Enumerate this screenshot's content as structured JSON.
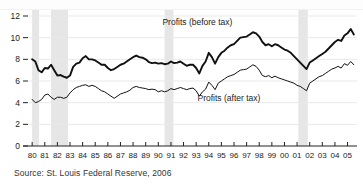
{
  "figure": {
    "source_note": "Source: St. Louis Federal Reserve, 2006",
    "label_before_tax": "Profits (before tax)",
    "label_after_tax": "Profits (after tax)"
  },
  "colors": {
    "before_tax_line": "#111111",
    "after_tax_line": "#111111",
    "recession_band": "#e6e6e6",
    "gridline": "#e9e9e9",
    "axis": "#222222",
    "background": "#ffffff"
  },
  "chart_data": {
    "type": "line",
    "title": "",
    "subtitle": "",
    "xlabel": "",
    "ylabel": "",
    "xlim": [
      1979.75,
      2005.75
    ],
    "ylim": [
      0,
      12
    ],
    "yticks": [
      0,
      2,
      4,
      6,
      8,
      10,
      12
    ],
    "ytick_labels": [
      "0",
      "2",
      "4",
      "6",
      "8",
      "10",
      "12"
    ],
    "xticks": [
      1980,
      1981,
      1982,
      1983,
      1984,
      1985,
      1986,
      1987,
      1988,
      1989,
      1990,
      1991,
      1992,
      1993,
      1994,
      1995,
      1996,
      1997,
      1998,
      1999,
      2000,
      2001,
      2002,
      2003,
      2004,
      2005
    ],
    "xtick_labels": [
      "80",
      "81",
      "82",
      "83",
      "84",
      "85",
      "86",
      "87",
      "88",
      "89",
      "90",
      "91",
      "92",
      "93",
      "94",
      "95",
      "96",
      "97",
      "98",
      "99",
      "00",
      "01",
      "02",
      "03",
      "04",
      "05"
    ],
    "grid": true,
    "legend_position": "inline-annotation",
    "annotations": [
      {
        "text": "Profits (before tax)",
        "x": 1993.1,
        "y": 11.2
      },
      {
        "text": "Profits (after tax)",
        "x": 1995.6,
        "y": 4.15
      }
    ],
    "shaded_regions": [
      {
        "label": "recession",
        "x0": 1980.0,
        "x1": 1980.55
      },
      {
        "label": "recession",
        "x0": 1981.5,
        "x1": 1982.85
      },
      {
        "label": "recession",
        "x0": 1990.5,
        "x1": 1991.2
      },
      {
        "label": "recession",
        "x0": 2001.1,
        "x1": 2001.85
      }
    ],
    "series": [
      {
        "name": "Profits (before tax)",
        "x": [
          1980.0,
          1980.25,
          1980.5,
          1980.75,
          1981.0,
          1981.25,
          1981.5,
          1981.75,
          1982.0,
          1982.25,
          1982.5,
          1982.75,
          1983.0,
          1983.25,
          1983.5,
          1983.75,
          1984.0,
          1984.25,
          1984.5,
          1984.75,
          1985.0,
          1985.25,
          1985.5,
          1985.75,
          1986.0,
          1986.25,
          1986.5,
          1986.75,
          1987.0,
          1987.25,
          1987.5,
          1987.75,
          1988.0,
          1988.25,
          1988.5,
          1988.75,
          1989.0,
          1989.25,
          1989.5,
          1989.75,
          1990.0,
          1990.25,
          1990.5,
          1990.75,
          1991.0,
          1991.25,
          1991.5,
          1991.75,
          1992.0,
          1992.25,
          1992.5,
          1992.75,
          1993.0,
          1993.25,
          1993.5,
          1993.75,
          1994.0,
          1994.25,
          1994.5,
          1994.75,
          1995.0,
          1995.25,
          1995.5,
          1995.75,
          1996.0,
          1996.25,
          1996.5,
          1996.75,
          1997.0,
          1997.25,
          1997.5,
          1997.75,
          1998.0,
          1998.25,
          1998.5,
          1998.75,
          1999.0,
          1999.25,
          1999.5,
          1999.75,
          2000.0,
          2000.25,
          2000.5,
          2000.75,
          2001.0,
          2001.25,
          2001.5,
          2001.75,
          2002.0,
          2002.25,
          2002.5,
          2002.75,
          2003.0,
          2003.25,
          2003.5,
          2003.75,
          2004.0,
          2004.25,
          2004.5,
          2004.75,
          2005.0,
          2005.25,
          2005.5
        ],
        "y": [
          8.0,
          7.8,
          7.0,
          6.8,
          7.2,
          7.15,
          7.5,
          7.0,
          6.5,
          6.55,
          6.4,
          6.3,
          6.5,
          7.3,
          7.6,
          7.7,
          8.1,
          8.3,
          8.0,
          8.0,
          7.9,
          7.7,
          7.5,
          7.5,
          7.2,
          7.0,
          7.1,
          7.3,
          7.5,
          7.6,
          7.8,
          8.0,
          8.2,
          8.35,
          8.2,
          8.15,
          8.0,
          7.75,
          7.65,
          7.7,
          7.6,
          7.65,
          7.55,
          7.6,
          7.8,
          7.65,
          7.7,
          7.8,
          7.6,
          7.4,
          7.5,
          7.5,
          7.2,
          6.7,
          7.4,
          7.8,
          8.6,
          8.2,
          7.6,
          8.2,
          8.6,
          8.8,
          9.1,
          9.3,
          9.4,
          9.7,
          10.0,
          10.05,
          10.1,
          10.3,
          10.5,
          10.4,
          10.1,
          9.6,
          9.3,
          9.4,
          9.2,
          9.4,
          9.3,
          9.1,
          8.9,
          8.8,
          8.6,
          8.3,
          8.0,
          7.7,
          7.4,
          7.1,
          7.7,
          7.9,
          8.1,
          8.3,
          8.5,
          8.7,
          9.0,
          9.3,
          9.6,
          9.8,
          9.7,
          10.2,
          10.4,
          10.8,
          10.3
        ],
        "peak": {
          "year": 2005.25,
          "value": 10.8
        },
        "trough": {
          "year": 2001.75,
          "value": 7.1
        },
        "start_value": 8.0,
        "end_value": 10.3
      },
      {
        "name": "Profits (after tax)",
        "x": [
          1980.0,
          1980.25,
          1980.5,
          1980.75,
          1981.0,
          1981.25,
          1981.5,
          1981.75,
          1982.0,
          1982.25,
          1982.5,
          1982.75,
          1983.0,
          1983.25,
          1983.5,
          1983.75,
          1984.0,
          1984.25,
          1984.5,
          1984.75,
          1985.0,
          1985.25,
          1985.5,
          1985.75,
          1986.0,
          1986.25,
          1986.5,
          1986.75,
          1987.0,
          1987.25,
          1987.5,
          1987.75,
          1988.0,
          1988.25,
          1988.5,
          1988.75,
          1989.0,
          1989.25,
          1989.5,
          1989.75,
          1990.0,
          1990.25,
          1990.5,
          1990.75,
          1991.0,
          1991.25,
          1991.5,
          1991.75,
          1992.0,
          1992.25,
          1992.5,
          1992.75,
          1993.0,
          1993.25,
          1993.5,
          1993.75,
          1994.0,
          1994.25,
          1994.5,
          1994.75,
          1995.0,
          1995.25,
          1995.5,
          1995.75,
          1996.0,
          1996.25,
          1996.5,
          1996.75,
          1997.0,
          1997.25,
          1997.5,
          1997.75,
          1998.0,
          1998.25,
          1998.5,
          1998.75,
          1999.0,
          1999.25,
          1999.5,
          1999.75,
          2000.0,
          2000.25,
          2000.5,
          2000.75,
          2001.0,
          2001.25,
          2001.5,
          2001.75,
          2002.0,
          2002.25,
          2002.5,
          2002.75,
          2003.0,
          2003.25,
          2003.5,
          2003.75,
          2004.0,
          2004.25,
          2004.5,
          2004.75,
          2005.0,
          2005.25,
          2005.5
        ],
        "y": [
          4.3,
          4.0,
          4.1,
          4.3,
          4.7,
          4.8,
          4.5,
          4.3,
          4.5,
          4.5,
          4.4,
          4.5,
          4.9,
          5.2,
          5.4,
          5.5,
          5.6,
          5.65,
          5.5,
          5.6,
          5.5,
          5.3,
          5.1,
          5.0,
          4.8,
          4.6,
          4.4,
          4.6,
          4.8,
          4.9,
          5.0,
          5.15,
          5.4,
          5.5,
          5.4,
          5.35,
          5.3,
          5.2,
          5.25,
          5.2,
          5.0,
          5.1,
          5.0,
          5.1,
          5.3,
          5.2,
          5.3,
          5.4,
          5.3,
          5.2,
          5.3,
          5.35,
          5.1,
          4.6,
          5.0,
          5.25,
          5.9,
          5.6,
          5.2,
          5.8,
          6.0,
          6.2,
          6.4,
          6.5,
          6.6,
          6.8,
          7.0,
          7.05,
          7.1,
          7.3,
          7.5,
          7.35,
          7.0,
          6.5,
          6.4,
          6.5,
          6.3,
          6.45,
          6.3,
          6.2,
          6.1,
          6.0,
          5.9,
          5.8,
          5.6,
          5.5,
          5.3,
          5.1,
          5.8,
          6.0,
          6.2,
          6.4,
          6.5,
          6.7,
          6.9,
          7.1,
          7.2,
          7.35,
          7.2,
          7.6,
          7.45,
          7.8,
          7.5
        ],
        "peak": {
          "year": 2005.25,
          "value": 7.8
        },
        "trough": {
          "year": 1980.25,
          "value": 4.0
        },
        "start_value": 4.3,
        "end_value": 7.5
      }
    ]
  }
}
